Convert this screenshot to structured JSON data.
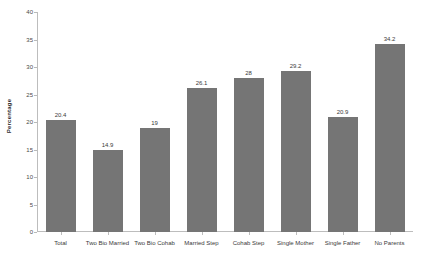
{
  "chart_data": {
    "type": "bar",
    "title": "",
    "subtitle": "",
    "xlabel": "",
    "ylabel": "Percentage",
    "ylim": [
      0,
      40
    ],
    "yticks": [
      0,
      5,
      10,
      15,
      20,
      25,
      30,
      35,
      40
    ],
    "ytick_labels": [
      "0",
      "5",
      "10",
      "15",
      "20",
      "25",
      "30",
      "35",
      "40"
    ],
    "grid": false,
    "legend": false,
    "legend_position": "none",
    "bar_color": "#757575",
    "axis_color": "#bdbdbd",
    "categories": [
      "Total",
      "Two Bio Married",
      "Two Bio Cohab",
      "Married Step",
      "Cohab Step",
      "Single Mother",
      "Single Father",
      "No Parents"
    ],
    "values": [
      20.4,
      14.9,
      19,
      26.1,
      28,
      29.2,
      20.9,
      34.2
    ],
    "value_labels": [
      "20.4",
      "14.9",
      "19",
      "26.1",
      "28",
      "29.2",
      "20.9",
      "34.2"
    ]
  }
}
